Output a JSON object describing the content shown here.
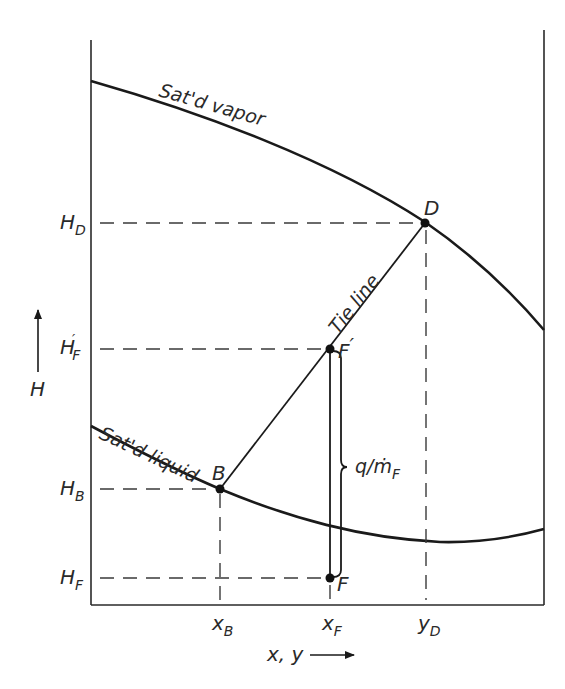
{
  "diagram": {
    "axes": {
      "y_axis_label": "H",
      "x_axis_label": "x, y"
    },
    "curves": {
      "vapor": {
        "label": "Sat'd vapor"
      },
      "liquid": {
        "label": "Sat'd liquid"
      },
      "tie_line": {
        "label": "Tie line"
      }
    },
    "points": {
      "D": {
        "label": "D"
      },
      "F_prime": {
        "label": "F",
        "prime": "′"
      },
      "B": {
        "label": "B"
      },
      "F": {
        "label": "F"
      }
    },
    "y_ticks": {
      "H_D": {
        "main": "H",
        "sub": "D"
      },
      "H_F_prime": {
        "main": "H",
        "sub": "F",
        "prime": "′"
      },
      "H_B": {
        "main": "H",
        "sub": "B"
      },
      "H_F": {
        "main": "H",
        "sub": "F"
      }
    },
    "x_ticks": {
      "x_B": {
        "main": "x",
        "sub": "B"
      },
      "x_F": {
        "main": "x",
        "sub": "F"
      },
      "y_D": {
        "main": "y",
        "sub": "D"
      }
    },
    "heat_brace": {
      "q": "q",
      "slash": "/",
      "m": "ṁ",
      "sub": "F"
    },
    "colors": {
      "ink": "#1a1a1a",
      "background": "#ffffff"
    }
  }
}
